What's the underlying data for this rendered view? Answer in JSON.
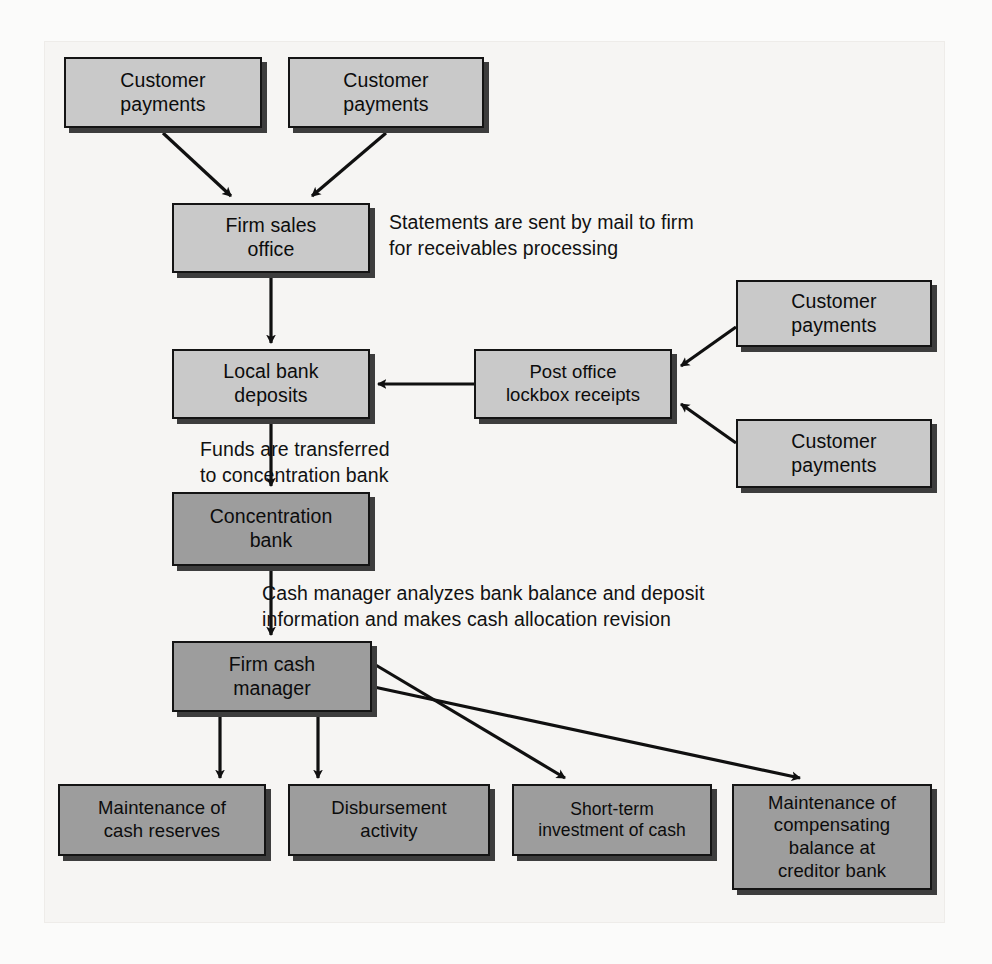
{
  "diagram": {
    "colors": {
      "node_fill_light": "#c9c9c9",
      "node_fill_dark": "#9d9d9d",
      "node_border": "#141414",
      "shadow": "#3d3d3d",
      "panel_background": "#f6f5f3",
      "page_background": "#fbfbfa",
      "text": "#0c0c0c"
    },
    "nodes": [
      {
        "id": "customer-payments-1",
        "label": "Customer\npayments",
        "shade": "light",
        "x": 64,
        "y": 57,
        "w": 198,
        "h": 71
      },
      {
        "id": "customer-payments-2",
        "label": "Customer\npayments",
        "shade": "light",
        "x": 288,
        "y": 57,
        "w": 196,
        "h": 71
      },
      {
        "id": "firm-sales-office",
        "label": "Firm sales\noffice",
        "shade": "light",
        "x": 172,
        "y": 203,
        "w": 198,
        "h": 70
      },
      {
        "id": "local-bank-deposits",
        "label": "Local bank\ndeposits",
        "shade": "light",
        "x": 172,
        "y": 349,
        "w": 198,
        "h": 70
      },
      {
        "id": "post-office-lockbox",
        "label": "Post office\nlockbox receipts",
        "shade": "light",
        "x": 474,
        "y": 349,
        "w": 198,
        "h": 70
      },
      {
        "id": "customer-payments-3",
        "label": "Customer\npayments",
        "shade": "light",
        "x": 736,
        "y": 280,
        "w": 196,
        "h": 67
      },
      {
        "id": "customer-payments-4",
        "label": "Customer\npayments",
        "shade": "light",
        "x": 736,
        "y": 419,
        "w": 196,
        "h": 69
      },
      {
        "id": "concentration-bank",
        "label": "Concentration\nbank",
        "shade": "dark",
        "x": 172,
        "y": 492,
        "w": 198,
        "h": 74
      },
      {
        "id": "firm-cash-manager",
        "label": "Firm cash\nmanager",
        "shade": "dark",
        "x": 172,
        "y": 641,
        "w": 200,
        "h": 71
      },
      {
        "id": "maintenance-cash-reserves",
        "label": "Maintenance of\ncash reserves",
        "shade": "dark",
        "x": 58,
        "y": 784,
        "w": 208,
        "h": 72
      },
      {
        "id": "disbursement-activity",
        "label": "Disbursement\nactivity",
        "shade": "dark",
        "x": 288,
        "y": 784,
        "w": 202,
        "h": 72
      },
      {
        "id": "short-term-investment",
        "label": "Short-term\ninvestment of cash",
        "shade": "dark",
        "x": 512,
        "y": 784,
        "w": 200,
        "h": 72
      },
      {
        "id": "maintenance-compensating",
        "label": "Maintenance of\ncompensating\nbalance at\ncreditor bank",
        "shade": "dark",
        "x": 732,
        "y": 784,
        "w": 200,
        "h": 106
      }
    ],
    "notes": [
      {
        "id": "note-statements",
        "text": "Statements are sent by mail to firm\nfor receivables processing",
        "x": 389,
        "y": 210
      },
      {
        "id": "note-funds",
        "text": "Funds are transferred\nto concentration bank",
        "x": 200,
        "y": 437
      },
      {
        "id": "note-cash-manager",
        "text": "Cash manager analyzes bank balance and deposit\ninformation and makes cash allocation revision",
        "x": 262,
        "y": 581
      }
    ],
    "edges": [
      {
        "id": "edge-cp1-to-firm-sales",
        "from": "customer-payments-1",
        "to": "firm-sales-office"
      },
      {
        "id": "edge-cp2-to-firm-sales",
        "from": "customer-payments-2",
        "to": "firm-sales-office"
      },
      {
        "id": "edge-firm-sales-to-local-bank",
        "from": "firm-sales-office",
        "to": "local-bank-deposits"
      },
      {
        "id": "edge-lockbox-to-local-bank",
        "from": "post-office-lockbox",
        "to": "local-bank-deposits"
      },
      {
        "id": "edge-cp3-to-lockbox",
        "from": "customer-payments-3",
        "to": "post-office-lockbox"
      },
      {
        "id": "edge-cp4-to-lockbox",
        "from": "customer-payments-4",
        "to": "post-office-lockbox"
      },
      {
        "id": "edge-local-bank-to-concentration",
        "from": "local-bank-deposits",
        "to": "concentration-bank"
      },
      {
        "id": "edge-concentration-to-cash-manager",
        "from": "concentration-bank",
        "to": "firm-cash-manager"
      },
      {
        "id": "edge-cash-manager-to-reserves",
        "from": "firm-cash-manager",
        "to": "maintenance-cash-reserves"
      },
      {
        "id": "edge-cash-manager-to-disbursement",
        "from": "firm-cash-manager",
        "to": "disbursement-activity"
      },
      {
        "id": "edge-cash-manager-to-investment",
        "from": "firm-cash-manager",
        "to": "short-term-investment"
      },
      {
        "id": "edge-cash-manager-to-compensating",
        "from": "firm-cash-manager",
        "to": "maintenance-compensating"
      }
    ]
  }
}
